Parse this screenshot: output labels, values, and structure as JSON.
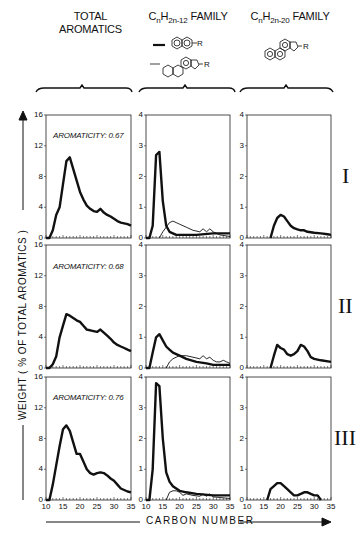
{
  "headers": {
    "col1_line1": "TOTAL",
    "col1_line2": "AROMATICS",
    "col2": "CnH2n-12 FAMILY",
    "col3": "CnH2n-20 FAMILY",
    "col2_r": "R",
    "col3_r": "R"
  },
  "axis": {
    "ylabel": "WEIGHT ( % OF TOTAL AROMATICS )",
    "xlabel": "CARBON NUMBER",
    "col1_yticks": [
      "16",
      "12",
      "8",
      "4",
      "0"
    ],
    "col23_yticks": [
      "4",
      "3",
      "2",
      "1",
      "0"
    ],
    "xticks": [
      "10",
      "15",
      "20",
      "25",
      "30",
      "35"
    ]
  },
  "rows": [
    {
      "roman": "I",
      "aromaticity": "AROMATICITY: 0.67"
    },
    {
      "roman": "II",
      "aromaticity": "AROMATICITY: 0.68"
    },
    {
      "roman": "III",
      "aromaticity": "AROMATICITY: 0.76"
    }
  ],
  "chart_data": {
    "type": "line",
    "xlabel": "CARBON NUMBER",
    "ylabel": "WEIGHT (% OF TOTAL AROMATICS)",
    "xlim": [
      10,
      35
    ],
    "grid": false,
    "panels": [
      {
        "row": "I",
        "column": "TOTAL AROMATICS",
        "annotation": "AROMATICITY: 0.67",
        "ylim": [
          0,
          16
        ],
        "series": [
          {
            "name": "Total aromatics",
            "x": [
              10,
              11,
              12,
              13,
              14,
              15,
              16,
              17,
              18,
              19,
              20,
              21,
              22,
              23,
              24,
              25,
              26,
              27,
              28,
              29,
              30,
              31,
              32,
              33,
              34,
              35
            ],
            "y": [
              0,
              0,
              1,
              3,
              4,
              7,
              10,
              10.5,
              9,
              7.5,
              6,
              5,
              4.2,
              3.8,
              3.5,
              3.4,
              3.8,
              3.3,
              3,
              2.8,
              2.5,
              2.2,
              2,
              1.9,
              1.8,
              1.6
            ]
          }
        ]
      },
      {
        "row": "I",
        "column": "CnH2n-12 FAMILY",
        "ylim": [
          0,
          4
        ],
        "series": [
          {
            "name": "Naphthalenes (thick)",
            "x": [
              10,
              11,
              12,
              13,
              14,
              15,
              16,
              17,
              18,
              19,
              20,
              25,
              30,
              35
            ],
            "y": [
              0,
              0,
              0.4,
              2.7,
              2.8,
              1.2,
              0.4,
              0.2,
              0.15,
              0.1,
              0.1,
              0.1,
              0.15,
              0.15
            ]
          },
          {
            "name": "Tetracyclic (thin)",
            "x": [
              14,
              15,
              16,
              17,
              18,
              19,
              20,
              22,
              24,
              26,
              27,
              28,
              29,
              30,
              31,
              32,
              35
            ],
            "y": [
              0,
              0.2,
              0.35,
              0.5,
              0.55,
              0.5,
              0.45,
              0.35,
              0.25,
              0.2,
              0.3,
              0.2,
              0.3,
              0.2,
              0.15,
              0.1,
              0.05
            ]
          }
        ]
      },
      {
        "row": "I",
        "column": "CnH2n-20 FAMILY",
        "ylim": [
          0,
          4
        ],
        "series": [
          {
            "name": "CnH2n-20",
            "x": [
              17,
              18,
              19,
              20,
              21,
              22,
              23,
              24,
              25,
              26,
              27,
              28,
              30,
              32,
              34,
              35
            ],
            "y": [
              0,
              0.4,
              0.65,
              0.75,
              0.7,
              0.55,
              0.4,
              0.32,
              0.28,
              0.25,
              0.25,
              0.2,
              0.17,
              0.15,
              0.12,
              0.1
            ]
          }
        ]
      },
      {
        "row": "II",
        "column": "TOTAL AROMATICS",
        "annotation": "AROMATICITY: 0.68",
        "ylim": [
          0,
          16
        ],
        "series": [
          {
            "name": "Total aromatics",
            "x": [
              10,
              11,
              12,
              13,
              14,
              15,
              16,
              17,
              18,
              19,
              20,
              21,
              22,
              23,
              24,
              25,
              26,
              27,
              28,
              29,
              30,
              31,
              32,
              33,
              34,
              35
            ],
            "y": [
              0,
              0,
              0.5,
              1.5,
              4,
              5.5,
              7,
              6.8,
              6.5,
              6.2,
              6,
              5.5,
              5,
              4.9,
              4.8,
              4.7,
              5,
              4.6,
              4.2,
              3.8,
              3.3,
              3,
              2.8,
              2.6,
              2.4,
              2.2
            ]
          }
        ]
      },
      {
        "row": "II",
        "column": "CnH2n-12 FAMILY",
        "ylim": [
          0,
          4
        ],
        "series": [
          {
            "name": "Naphthalenes (thick)",
            "x": [
              10,
              11,
              12,
              13,
              14,
              15,
              16,
              17,
              18,
              20,
              22,
              25,
              28,
              30,
              35
            ],
            "y": [
              0,
              0,
              0.5,
              1.0,
              1.1,
              0.9,
              0.7,
              0.6,
              0.5,
              0.4,
              0.3,
              0.2,
              0.15,
              0.1,
              0.1
            ]
          },
          {
            "name": "Tetracyclic (thin)",
            "x": [
              16,
              17,
              18,
              19,
              20,
              22,
              24,
              26,
              27,
              28,
              29,
              30,
              31,
              32,
              33,
              34,
              35
            ],
            "y": [
              0,
              0.2,
              0.3,
              0.35,
              0.4,
              0.4,
              0.35,
              0.3,
              0.4,
              0.3,
              0.35,
              0.25,
              0.2,
              0.2,
              0.25,
              0.2,
              0.15
            ]
          }
        ]
      },
      {
        "row": "II",
        "column": "CnH2n-20 FAMILY",
        "ylim": [
          0,
          4
        ],
        "series": [
          {
            "name": "CnH2n-20",
            "x": [
              17,
              18,
              19,
              20,
              21,
              22,
              23,
              24,
              25,
              26,
              27,
              28,
              29,
              30,
              32,
              35
            ],
            "y": [
              0,
              0.4,
              0.75,
              0.65,
              0.6,
              0.45,
              0.4,
              0.45,
              0.55,
              0.75,
              0.7,
              0.55,
              0.35,
              0.3,
              0.25,
              0.2
            ]
          }
        ]
      },
      {
        "row": "III",
        "column": "TOTAL AROMATICS",
        "annotation": "AROMATICITY: 0.76",
        "ylim": [
          0,
          16
        ],
        "series": [
          {
            "name": "Total aromatics",
            "x": [
              10,
              11,
              12,
              13,
              14,
              15,
              16,
              17,
              18,
              19,
              20,
              21,
              22,
              23,
              24,
              25,
              26,
              27,
              28,
              29,
              30,
              31,
              32,
              33,
              34,
              35
            ],
            "y": [
              0,
              0,
              2,
              4.5,
              7,
              9.2,
              9.7,
              9,
              7.5,
              6,
              6,
              5,
              4,
              3.5,
              3.3,
              3.5,
              3.6,
              3.5,
              3.2,
              2.8,
              2.5,
              2,
              1.5,
              1.3,
              1.1,
              1
            ]
          }
        ]
      },
      {
        "row": "III",
        "column": "CnH2n-12 FAMILY",
        "ylim": [
          0,
          4
        ],
        "series": [
          {
            "name": "Naphthalenes (thick)",
            "x": [
              10,
              11,
              12,
              13,
              14,
              15,
              16,
              17,
              18,
              20,
              22,
              25,
              30,
              35
            ],
            "y": [
              0,
              0,
              1,
              3.8,
              3.7,
              2,
              0.9,
              0.6,
              0.45,
              0.3,
              0.25,
              0.2,
              0.15,
              0.15
            ]
          },
          {
            "name": "Tetracyclic (thin)",
            "x": [
              16,
              17,
              18,
              19,
              20,
              21,
              22,
              24,
              26,
              27,
              28,
              29,
              30,
              32,
              35
            ],
            "y": [
              0,
              0.25,
              0.3,
              0.3,
              0.25,
              0.15,
              0.2,
              0.15,
              0.12,
              0.2,
              0.12,
              0.2,
              0.1,
              0.08,
              0.05
            ]
          }
        ]
      },
      {
        "row": "III",
        "column": "CnH2n-20 FAMILY",
        "ylim": [
          0,
          4
        ],
        "series": [
          {
            "name": "CnH2n-20",
            "x": [
              16,
              17,
              18,
              19,
              20,
              21,
              22,
              23,
              24,
              25,
              26,
              27,
              28,
              29,
              30,
              31,
              32
            ],
            "y": [
              0,
              0.35,
              0.45,
              0.55,
              0.55,
              0.45,
              0.35,
              0.25,
              0.15,
              0.15,
              0.2,
              0.25,
              0.25,
              0.2,
              0.15,
              0.15,
              0
            ]
          }
        ]
      }
    ]
  }
}
